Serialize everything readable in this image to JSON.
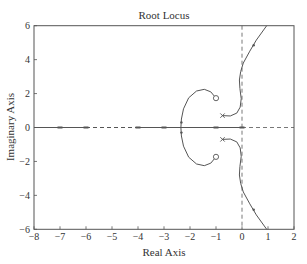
{
  "chart_data": {
    "type": "line",
    "title": "Root Locus",
    "xlabel": "Real Axis",
    "ylabel": "Imaginary Axis",
    "xlim": [
      -8,
      2
    ],
    "ylim": [
      -6,
      6
    ],
    "xticks": [
      -8,
      -7,
      -6,
      -5,
      -4,
      -3,
      -2,
      -1,
      0,
      1,
      2
    ],
    "yticks": [
      -6,
      -4,
      -2,
      0,
      2,
      4,
      6
    ],
    "grid": false,
    "legend": null,
    "reference_lines": [
      {
        "orientation": "vertical",
        "value": 0,
        "style": "dashed"
      },
      {
        "orientation": "horizontal",
        "value": 0,
        "style": "dashed",
        "from": 0,
        "to": 2
      }
    ],
    "poles": [
      {
        "re": -0.75,
        "im": 0.7
      },
      {
        "re": -0.75,
        "im": -0.7
      }
    ],
    "zeros": [
      {
        "re": -1.0,
        "im": 1.73
      },
      {
        "re": -1.0,
        "im": -1.73
      }
    ],
    "real_axis_segments": [
      {
        "from": -8,
        "to": -6,
        "style": "solid"
      },
      {
        "from": -6,
        "to": -4,
        "style": "dashed"
      },
      {
        "from": -4,
        "to": 0,
        "style": "solid"
      }
    ],
    "real_axis_markers": [
      -7,
      -6,
      -4,
      -3,
      -1,
      0
    ],
    "breakaway_point": {
      "re": -2.35,
      "im": 0
    },
    "series": [
      {
        "name": "zero-arc-upper",
        "points": [
          [
            -1.0,
            1.73
          ],
          [
            -1.2,
            2.1
          ],
          [
            -1.45,
            2.25
          ],
          [
            -1.75,
            2.15
          ],
          [
            -2.05,
            1.75
          ],
          [
            -2.25,
            1.1
          ],
          [
            -2.33,
            0.5
          ],
          [
            -2.35,
            0.0
          ]
        ]
      },
      {
        "name": "zero-arc-lower",
        "points": [
          [
            -1.0,
            -1.73
          ],
          [
            -1.2,
            -2.1
          ],
          [
            -1.45,
            -2.25
          ],
          [
            -1.75,
            -2.15
          ],
          [
            -2.05,
            -1.75
          ],
          [
            -2.25,
            -1.1
          ],
          [
            -2.33,
            -0.5
          ],
          [
            -2.35,
            0.0
          ]
        ]
      },
      {
        "name": "pole-branch-upper",
        "points": [
          [
            -0.75,
            0.7
          ],
          [
            -0.45,
            0.68
          ],
          [
            -0.2,
            0.85
          ],
          [
            -0.07,
            1.2
          ],
          [
            -0.03,
            1.7
          ],
          [
            -0.08,
            2.3
          ],
          [
            -0.1,
            2.8
          ],
          [
            -0.05,
            3.3
          ],
          [
            0.05,
            3.8
          ],
          [
            0.3,
            4.5
          ],
          [
            0.55,
            5.15
          ],
          [
            0.95,
            6.0
          ]
        ]
      },
      {
        "name": "pole-branch-lower",
        "points": [
          [
            -0.75,
            -0.7
          ],
          [
            -0.45,
            -0.68
          ],
          [
            -0.2,
            -0.85
          ],
          [
            -0.07,
            -1.2
          ],
          [
            -0.03,
            -1.7
          ],
          [
            -0.08,
            -2.3
          ],
          [
            -0.1,
            -2.8
          ],
          [
            -0.05,
            -3.3
          ],
          [
            0.05,
            -3.8
          ],
          [
            0.3,
            -4.5
          ],
          [
            0.55,
            -5.15
          ],
          [
            0.95,
            -6.0
          ]
        ]
      }
    ],
    "branch_arrows": [
      {
        "re": 0.45,
        "im": 4.85
      },
      {
        "re": 0.45,
        "im": -4.85
      },
      {
        "re": -2.33,
        "im": 0.3
      },
      {
        "re": -2.33,
        "im": -0.3
      }
    ]
  },
  "colors": {
    "axes": "#555555",
    "locus": "#555555",
    "text": "#333333",
    "background": "#ffffff"
  }
}
